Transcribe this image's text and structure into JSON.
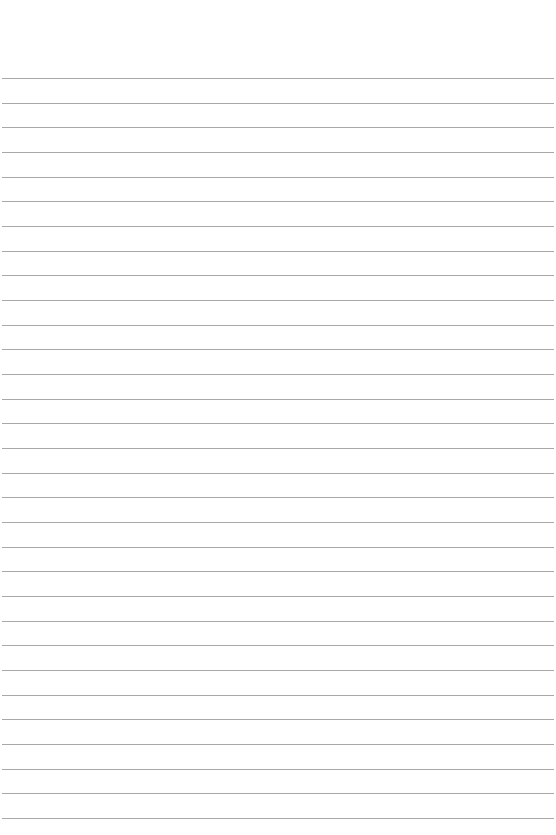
{
  "page": {
    "type": "lined-paper",
    "background_color": "#ffffff",
    "line_color": "#a8a8a8",
    "line_count": 31,
    "first_line_y": 78,
    "line_spacing": 24.67,
    "line_left": 2,
    "line_width": 552
  }
}
